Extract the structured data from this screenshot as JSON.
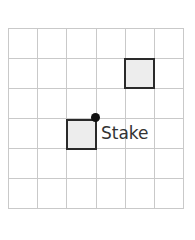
{
  "diagram": {
    "grid": {
      "columns": 6,
      "rows": 6,
      "line_color": "#c9c9c9"
    },
    "squares": [
      {
        "name": "upper-right-square",
        "col": 4,
        "row": 1,
        "fill": "#ededed",
        "stroke": "#2a2a2a"
      },
      {
        "name": "lower-left-square",
        "col": 2,
        "row": 3,
        "fill": "#ededed",
        "stroke": "#2a2a2a"
      }
    ],
    "stake": {
      "label": "Stake",
      "color": "#111111"
    }
  }
}
